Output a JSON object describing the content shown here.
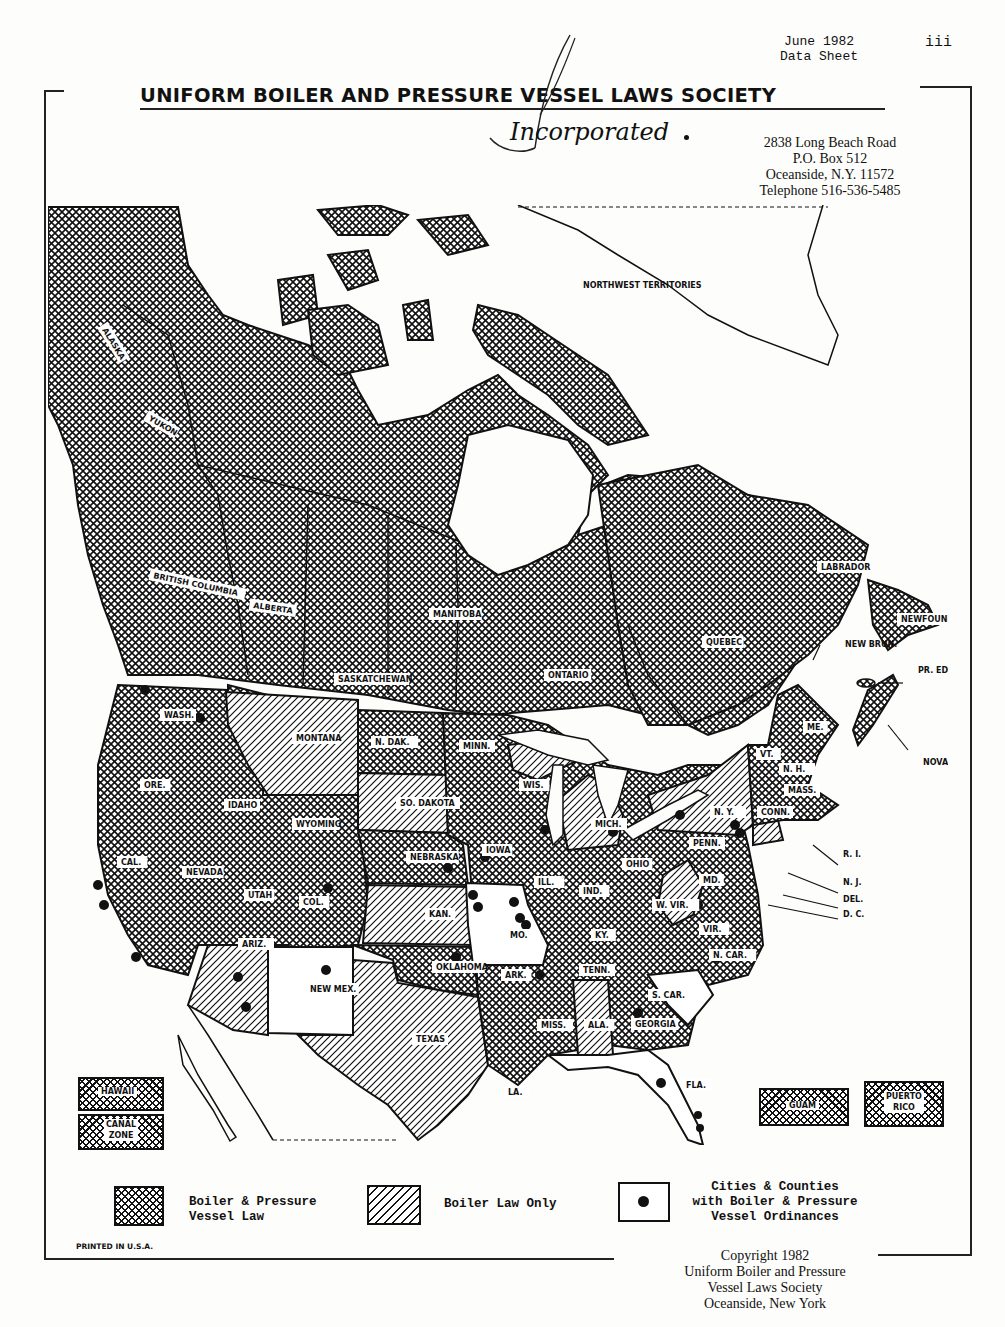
{
  "header": {
    "date": "June 1982",
    "doc_type": "Data Sheet",
    "page_number": "iii",
    "title": "UNIFORM BOILER AND PRESSURE VESSEL LAWS SOCIETY",
    "subtitle": "Incorporated",
    "address": [
      "2838 Long Beach Road",
      "P.O. Box 512",
      "Oceanside, N.Y. 11572",
      "Telephone 516-536-5485"
    ]
  },
  "map": {
    "labels": {
      "alaska": "ALASKA",
      "yukon": "YUKON",
      "nwt": "NORTHWEST TERRITORIES",
      "bc": "BRITISH COLUMBIA",
      "alberta": "ALBERTA",
      "sask": "SASKATCHEWAN",
      "manitoba": "MANITOBA",
      "ontario": "ONTARIO",
      "quebec": "QUEBEC",
      "labrador": "LABRADOR",
      "newfoundland": "NEWFOUNDLAND",
      "newbrun": "NEW BRUN.",
      "pei": "PR. ED. IS.",
      "novascotia": "NOVA SCOTIA",
      "wash": "WASH.",
      "ore": "ORE.",
      "cal": "CAL.",
      "idaho": "IDAHO",
      "nevada": "NEVADA",
      "utah": "UTAH",
      "ariz": "ARIZ.",
      "montana": "MONTANA",
      "wyoming": "WYOMING",
      "col": "COL.",
      "newmex": "NEW MEX.",
      "ndak": "N. DAK.",
      "sodakota": "SO. DAKOTA",
      "nebraska": "NEBRASKA",
      "kan": "KAN.",
      "oklahoma": "OKLAHOMA",
      "texas": "TEXAS",
      "minn": "MINN.",
      "iowa": "IOWA",
      "mo": "MO.",
      "ark": "ARK.",
      "la": "LA.",
      "wis": "WIS.",
      "ill": "ILL.",
      "mich": "MICH.",
      "ind": "IND.",
      "ohio": "OHIO",
      "ky": "KY.",
      "tenn": "TENN.",
      "miss": "MISS.",
      "ala": "ALA.",
      "georgia": "GEORGIA",
      "fla": "FLA.",
      "scar": "S. CAR.",
      "ncar": "N. CAR.",
      "vir": "VIR.",
      "wvir": "W. VIR.",
      "md": "MD.",
      "penn": "PENN.",
      "ny": "N. Y.",
      "vt": "VT.",
      "nh": "N. H.",
      "me": "ME.",
      "mass": "MASS.",
      "conn": "CONN.",
      "ri": "R. I.",
      "nj": "N. J.",
      "del": "DEL.",
      "dc": "D. C."
    },
    "insets": {
      "hawaii": "HAWAII",
      "canal_zone": [
        "CANAL",
        "ZONE"
      ],
      "guam": "GUAM",
      "puerto_rico": [
        "PUERTO",
        "RICO"
      ]
    },
    "categories": {
      "boiler_and_pressure_vessel_law": [
        "Alaska",
        "Yukon",
        "British Columbia",
        "Alberta",
        "Saskatchewan",
        "Manitoba",
        "Ontario",
        "Quebec",
        "Labrador",
        "Newfoundland",
        "New Brunswick",
        "Prince Edward Island",
        "Nova Scotia",
        "Northwest Territories islands",
        "Washington",
        "Oregon",
        "California",
        "Idaho",
        "Nevada",
        "Utah",
        "Wyoming",
        "Colorado",
        "North Dakota",
        "Nebraska",
        "Oklahoma",
        "Minnesota",
        "Iowa",
        "Arkansas",
        "Louisiana",
        "Wisconsin",
        "Illinois",
        "Indiana",
        "Ohio",
        "Kentucky",
        "Tennessee",
        "Mississippi",
        "Georgia",
        "North Carolina",
        "Virginia",
        "Maryland",
        "Pennsylvania",
        "Vermont",
        "New Hampshire",
        "Maine",
        "Massachusetts",
        "Rhode Island",
        "New Jersey",
        "Delaware",
        "Hawaii",
        "Canal Zone",
        "Guam",
        "Puerto Rico"
      ],
      "boiler_law_only": [
        "Montana",
        "South Dakota",
        "Kansas",
        "Arizona",
        "Texas",
        "Michigan",
        "New York",
        "Alabama",
        "West Virginia",
        "Connecticut"
      ],
      "no_law": [
        "New Mexico",
        "Missouri",
        "South Carolina",
        "Florida"
      ]
    }
  },
  "legend": {
    "item1": [
      "Boiler & Pressure",
      "Vessel Law"
    ],
    "item2": "Boiler Law Only",
    "item3": [
      "Cities & Counties",
      "with Boiler & Pressure",
      "Vessel Ordinances"
    ]
  },
  "footer": {
    "printed": "PRINTED IN U.S.A.",
    "copyright": [
      "Copyright 1982",
      "Uniform Boiler and Pressure",
      "Vessel Laws Society",
      "Oceanside, New York"
    ]
  }
}
